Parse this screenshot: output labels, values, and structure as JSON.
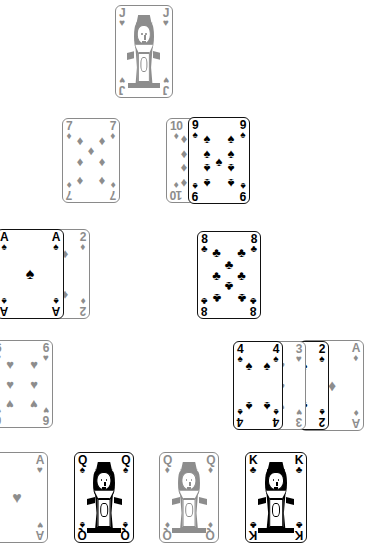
{
  "scene": {
    "title": "Playing card spread",
    "background_color": "#ffffff",
    "black_suit_color": "#000000",
    "red_suit_color": "#8d8d8d",
    "suit_glyphs": {
      "spades": "♠",
      "hearts": "♥",
      "diamonds": "♦",
      "clubs": "♣"
    }
  },
  "cards": [
    {
      "id": "jack-of-hearts",
      "rank": "J",
      "suit": "hearts",
      "suit_glyph": "♥",
      "color_class": "gray",
      "kind": "court",
      "x": 115,
      "y": 5,
      "w": 58,
      "h": 93,
      "z": 1
    },
    {
      "id": "seven-of-diamonds",
      "rank": "7",
      "suit": "diamonds",
      "suit_glyph": "♦",
      "color_class": "gray",
      "kind": "pip",
      "x": 62,
      "y": 118,
      "w": 58,
      "h": 85,
      "z": 1
    },
    {
      "id": "ten-of-diamonds",
      "rank": "10",
      "suit": "diamonds",
      "suit_glyph": "♦",
      "color_class": "gray",
      "kind": "pip",
      "x": 166,
      "y": 118,
      "w": 58,
      "h": 85,
      "z": 1
    },
    {
      "id": "nine-of-spades",
      "rank": "9",
      "suit": "spades",
      "suit_glyph": "♠",
      "color_class": "black",
      "kind": "pip",
      "x": 188,
      "y": 117,
      "w": 62,
      "h": 87,
      "z": 2
    },
    {
      "id": "ace-of-spades",
      "rank": "A",
      "suit": "spades",
      "suit_glyph": "♠",
      "color_class": "black",
      "kind": "ace",
      "x": -4,
      "y": 229,
      "w": 68,
      "h": 90,
      "z": 2
    },
    {
      "id": "two-of-diamonds",
      "rank": "2",
      "suit": "diamonds",
      "suit_glyph": "♦",
      "color_class": "gray",
      "kind": "pip",
      "x": 40,
      "y": 229,
      "w": 50,
      "h": 90,
      "z": 1
    },
    {
      "id": "eight-of-clubs",
      "rank": "8",
      "suit": "clubs",
      "suit_glyph": "♣",
      "color_class": "black",
      "kind": "pip",
      "x": 197,
      "y": 231,
      "w": 64,
      "h": 88,
      "z": 1
    },
    {
      "id": "six-of-hearts",
      "rank": "6",
      "suit": "hearts",
      "suit_glyph": "♥",
      "color_class": "gray",
      "kind": "pip",
      "x": -9,
      "y": 340,
      "w": 62,
      "h": 88,
      "z": 1
    },
    {
      "id": "four-of-spades",
      "rank": "4",
      "suit": "spades",
      "suit_glyph": "♠",
      "color_class": "black",
      "kind": "pip",
      "x": 233,
      "y": 341,
      "w": 50,
      "h": 89,
      "z": 4
    },
    {
      "id": "three-of-hearts",
      "rank": "3",
      "suit": "hearts",
      "suit_glyph": "♥",
      "color_class": "gray",
      "kind": "pip",
      "x": 256,
      "y": 341,
      "w": 50,
      "h": 89,
      "z": 3
    },
    {
      "id": "two-of-spades",
      "rank": "2",
      "suit": "spades",
      "suit_glyph": "♠",
      "color_class": "black",
      "kind": "pip",
      "x": 279,
      "y": 341,
      "w": 50,
      "h": 89,
      "z": 2
    },
    {
      "id": "ace-of-diamonds",
      "rank": "A",
      "suit": "diamonds",
      "suit_glyph": "♦",
      "color_class": "gray",
      "kind": "ace",
      "x": 300,
      "y": 340,
      "w": 64,
      "h": 91,
      "z": 1
    },
    {
      "id": "ace-of-hearts",
      "rank": "A",
      "suit": "hearts",
      "suit_glyph": "♥",
      "color_class": "gray",
      "kind": "ace",
      "x": -14,
      "y": 452,
      "w": 62,
      "h": 91,
      "z": 1
    },
    {
      "id": "queen-of-spades",
      "rank": "Q",
      "suit": "spades",
      "suit_glyph": "♠",
      "color_class": "black",
      "kind": "court",
      "x": 74,
      "y": 452,
      "w": 60,
      "h": 91,
      "z": 1
    },
    {
      "id": "queen-of-diamonds",
      "rank": "Q",
      "suit": "diamonds",
      "suit_glyph": "♦",
      "color_class": "gray",
      "kind": "court",
      "x": 159,
      "y": 452,
      "w": 60,
      "h": 91,
      "z": 1
    },
    {
      "id": "king-of-clubs",
      "rank": "K",
      "suit": "clubs",
      "suit_glyph": "♣",
      "color_class": "black",
      "kind": "court",
      "x": 245,
      "y": 452,
      "w": 62,
      "h": 91,
      "z": 1
    }
  ],
  "pip_layouts": {
    "A": [
      [
        50,
        50,
        "big"
      ]
    ],
    "2": [
      [
        50,
        18
      ],
      [
        50,
        82,
        "inv"
      ]
    ],
    "3": [
      [
        50,
        18
      ],
      [
        50,
        50
      ],
      [
        50,
        82,
        "inv"
      ]
    ],
    "4": [
      [
        25,
        18
      ],
      [
        75,
        18
      ],
      [
        25,
        82,
        "inv"
      ],
      [
        75,
        82,
        "inv"
      ]
    ],
    "6": [
      [
        25,
        18
      ],
      [
        75,
        18
      ],
      [
        25,
        50
      ],
      [
        75,
        50
      ],
      [
        25,
        82,
        "inv"
      ],
      [
        75,
        82,
        "inv"
      ]
    ],
    "7": [
      [
        25,
        16
      ],
      [
        75,
        16
      ],
      [
        50,
        33
      ],
      [
        25,
        50
      ],
      [
        75,
        50
      ],
      [
        25,
        84,
        "inv"
      ],
      [
        75,
        84,
        "inv"
      ]
    ],
    "8": [
      [
        25,
        14
      ],
      [
        75,
        14
      ],
      [
        50,
        33
      ],
      [
        25,
        50
      ],
      [
        75,
        50
      ],
      [
        50,
        67,
        "inv"
      ],
      [
        25,
        86,
        "inv"
      ],
      [
        75,
        86,
        "inv"
      ]
    ],
    "9": [
      [
        25,
        14
      ],
      [
        75,
        14
      ],
      [
        25,
        38
      ],
      [
        75,
        38
      ],
      [
        50,
        50
      ],
      [
        25,
        62,
        "inv"
      ],
      [
        75,
        62,
        "inv"
      ],
      [
        25,
        86,
        "inv"
      ],
      [
        75,
        86,
        "inv"
      ]
    ],
    "10": [
      [
        25,
        13
      ],
      [
        75,
        13
      ],
      [
        50,
        27
      ],
      [
        25,
        38
      ],
      [
        75,
        38
      ],
      [
        25,
        62,
        "inv"
      ],
      [
        75,
        62,
        "inv"
      ],
      [
        50,
        73,
        "inv"
      ],
      [
        25,
        87,
        "inv"
      ],
      [
        75,
        87,
        "inv"
      ]
    ]
  }
}
